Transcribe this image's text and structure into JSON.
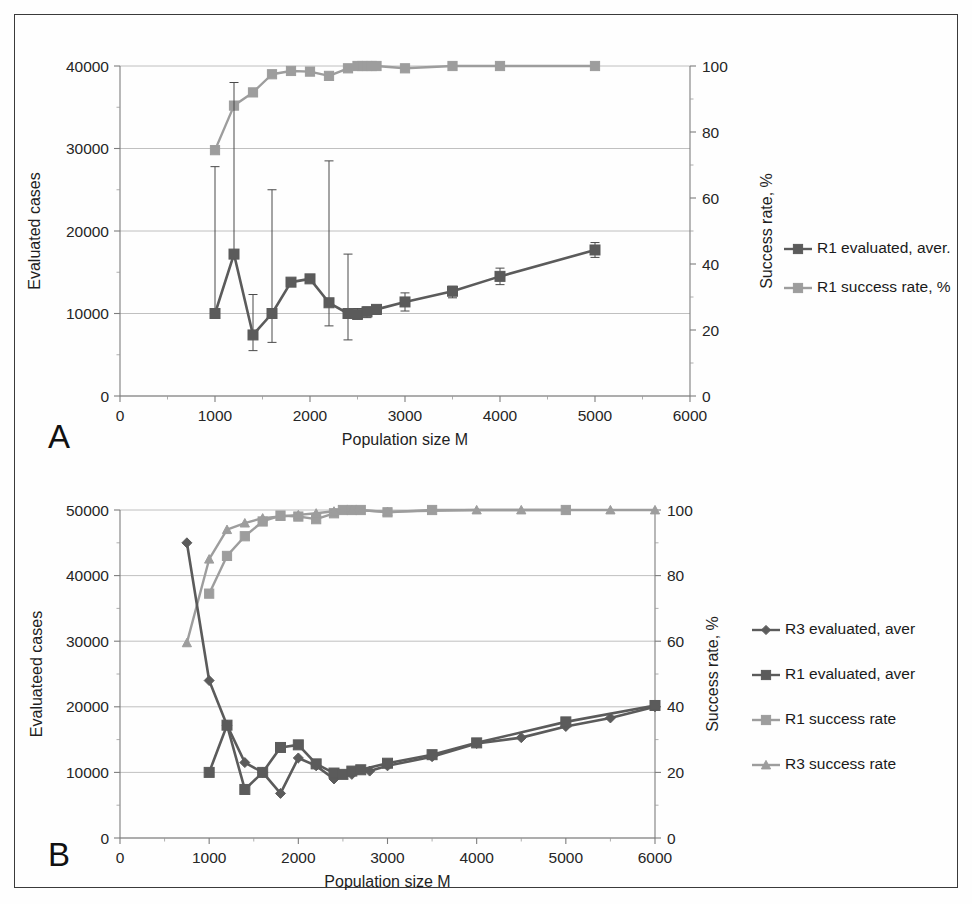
{
  "figure": {
    "panel_a_letter": "A",
    "panel_b_letter": "B"
  },
  "chart_data": [
    {
      "id": "panel_a",
      "type": "line",
      "title": "",
      "panel_label": "A",
      "xlabel": "Population size M",
      "ylabel": "Evaluated cases",
      "y2label": "Success rate, %",
      "xlim": [
        0,
        6000
      ],
      "ylim": [
        0,
        40000
      ],
      "y2lim": [
        0,
        100
      ],
      "xticks": [
        0,
        1000,
        2000,
        3000,
        4000,
        5000,
        6000
      ],
      "yticks": [
        0,
        10000,
        20000,
        30000,
        40000
      ],
      "y2ticks": [
        0,
        20,
        40,
        60,
        80,
        100
      ],
      "grid": true,
      "legend_position": "right",
      "series": [
        {
          "name": "R1 evaluated, aver.",
          "axis": "left",
          "marker": "square",
          "color": "#5b5b5b",
          "has_error_bars": true,
          "x": [
            1000,
            1200,
            1400,
            1600,
            1800,
            2000,
            2200,
            2400,
            2500,
            2600,
            2700,
            3000,
            3500,
            4000,
            5000
          ],
          "y": [
            10000,
            17200,
            7400,
            10000,
            13800,
            14200,
            11300,
            10000,
            9900,
            10200,
            10500,
            11400,
            12700,
            14500,
            17700
          ],
          "err_low": [
            10000,
            17200,
            5500,
            6500,
            13800,
            14200,
            8500,
            6800,
            9300,
            9500,
            9900,
            10300,
            11900,
            13500,
            16800
          ],
          "err_high": [
            27800,
            38000,
            12300,
            25000,
            13800,
            14200,
            28500,
            17200,
            10600,
            10800,
            11000,
            12500,
            13300,
            15500,
            18600
          ]
        },
        {
          "name": "R1 success rate, %",
          "axis": "right",
          "marker": "square",
          "color": "#9d9d9d",
          "has_error_bars": false,
          "x": [
            1000,
            1200,
            1400,
            1600,
            1800,
            2000,
            2200,
            2400,
            2500,
            2550,
            2600,
            2650,
            2700,
            3000,
            3500,
            4000,
            5000
          ],
          "y": [
            74.5,
            88.0,
            92.0,
            97.5,
            98.5,
            98.3,
            97.0,
            99.3,
            100.0,
            100.0,
            100.0,
            100.0,
            100.0,
            99.3,
            100.0,
            100.0,
            100.0
          ]
        }
      ]
    },
    {
      "id": "panel_b",
      "type": "line",
      "title": "",
      "panel_label": "B",
      "xlabel": "Population size M",
      "ylabel": "Evaluateed cases",
      "y2label": "Success rate, %",
      "xlim": [
        0,
        6000
      ],
      "ylim": [
        0,
        50000
      ],
      "y2lim": [
        0,
        100
      ],
      "xticks": [
        0,
        1000,
        2000,
        3000,
        4000,
        5000,
        6000
      ],
      "yticks": [
        0,
        10000,
        20000,
        30000,
        40000,
        50000
      ],
      "y2ticks": [
        0,
        20,
        40,
        60,
        80,
        100
      ],
      "grid": true,
      "legend_position": "right",
      "series": [
        {
          "name": "R3 evaluated, aver",
          "axis": "left",
          "marker": "diamond",
          "color": "#5b5b5b",
          "x": [
            750,
            1000,
            1200,
            1400,
            1600,
            1800,
            2000,
            2200,
            2400,
            2600,
            2800,
            3000,
            3500,
            4000,
            4500,
            5000,
            5500,
            6000
          ],
          "y": [
            45000,
            24000,
            17200,
            11500,
            10000,
            6800,
            12200,
            11000,
            9000,
            9700,
            10200,
            11000,
            12400,
            14400,
            15300,
            17000,
            18300,
            20000
          ]
        },
        {
          "name": "R1 evaluated, aver",
          "axis": "left",
          "marker": "square",
          "color": "#5b5b5b",
          "x": [
            1000,
            1200,
            1400,
            1600,
            1800,
            2000,
            2200,
            2400,
            2500,
            2600,
            2700,
            3000,
            3500,
            4000,
            5000,
            6000
          ],
          "y": [
            10000,
            17200,
            7400,
            10000,
            13800,
            14200,
            11300,
            9900,
            9700,
            10200,
            10400,
            11400,
            12700,
            14500,
            17700,
            20200
          ]
        },
        {
          "name": "R1 success rate",
          "axis": "right",
          "marker": "square",
          "color": "#9d9d9d",
          "x": [
            1000,
            1200,
            1400,
            1600,
            1800,
            2000,
            2200,
            2400,
            2500,
            2600,
            2700,
            3000,
            3500,
            5000
          ],
          "y": [
            74.5,
            86.0,
            92.0,
            96.5,
            98.3,
            98.0,
            97.2,
            99.0,
            100.0,
            100.0,
            100.0,
            99.3,
            100.0,
            100.0
          ]
        },
        {
          "name": "R3 success rate",
          "axis": "right",
          "marker": "triangle",
          "color": "#9d9d9d",
          "x": [
            750,
            1000,
            1200,
            1400,
            1600,
            1800,
            2000,
            2200,
            2400,
            2600,
            3000,
            4000,
            4500,
            5500,
            6000
          ],
          "y": [
            59.5,
            85.0,
            94.0,
            96.0,
            97.5,
            98.0,
            98.5,
            99.0,
            99.6,
            100.0,
            99.5,
            100.0,
            100.0,
            100.0,
            100.0
          ]
        }
      ]
    }
  ]
}
